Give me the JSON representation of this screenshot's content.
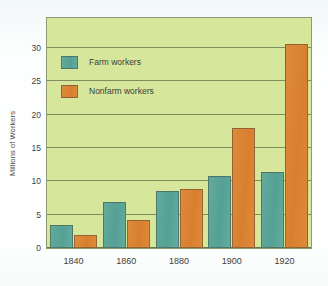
{
  "chart_data": {
    "type": "bar",
    "title": "",
    "subtitle": "",
    "xlabel": "",
    "ylabel": "Millions of Workers",
    "categories": [
      "1840",
      "1860",
      "1880",
      "1900",
      "1920"
    ],
    "series": [
      {
        "name": "Farm workers",
        "color": "#55a094",
        "values": [
          3.5,
          6.9,
          8.5,
          10.8,
          11.4
        ]
      },
      {
        "name": "Nonfarm workers",
        "color": "#d87f2f",
        "values": [
          1.9,
          4.2,
          8.9,
          18.0,
          30.6
        ]
      }
    ],
    "ylim": [
      0,
      34.5
    ],
    "yticks": [
      0,
      5,
      10,
      15,
      20,
      25,
      30
    ],
    "ytick_labels": [
      "0",
      "5",
      "10",
      "15",
      "20",
      "25",
      "30"
    ],
    "grid": true,
    "grid_axis": "y",
    "legend": {
      "position": "upper-left-inside",
      "entries": [
        {
          "label": "Farm workers",
          "color": "#55a094"
        },
        {
          "label": "Nonfarm workers",
          "color": "#d87f2f"
        }
      ]
    },
    "plot_background": "#d6e79b",
    "figure_background": "#fbfdfd",
    "axis_color": "#59633f"
  }
}
